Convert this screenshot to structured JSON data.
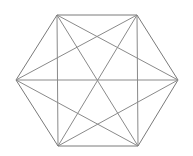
{
  "diagram": {
    "type": "complete-graph",
    "name": "K6",
    "stroke_color": "#8a8a8a",
    "vertices": [
      {
        "id": "top-left",
        "x": 57,
        "y": 15
      },
      {
        "id": "top-right",
        "x": 137,
        "y": 15
      },
      {
        "id": "right",
        "x": 178,
        "y": 80
      },
      {
        "id": "bottom-right",
        "x": 138,
        "y": 146
      },
      {
        "id": "bottom-left",
        "x": 58,
        "y": 146
      },
      {
        "id": "left",
        "x": 16,
        "y": 80
      }
    ]
  }
}
